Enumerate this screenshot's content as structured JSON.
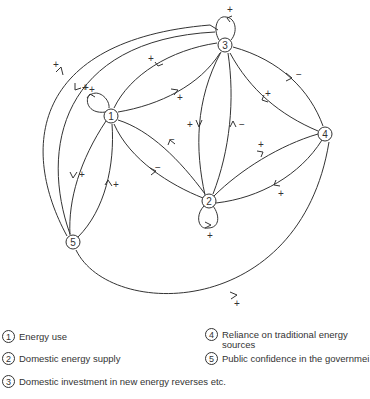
{
  "diagram": {
    "type": "causal-loop-diagram",
    "nodes": [
      {
        "id": "1",
        "label": "1"
      },
      {
        "id": "2",
        "label": "2"
      },
      {
        "id": "3",
        "label": "3"
      },
      {
        "id": "4",
        "label": "4"
      },
      {
        "id": "5",
        "label": "5"
      }
    ],
    "edges": [
      {
        "from": "1",
        "to": "1",
        "sign": "+"
      },
      {
        "from": "2",
        "to": "2",
        "sign": "+"
      },
      {
        "from": "3",
        "to": "3",
        "sign": "+"
      },
      {
        "from": "1",
        "to": "3",
        "sign": "+"
      },
      {
        "from": "3",
        "to": "1",
        "sign": "+"
      },
      {
        "from": "1",
        "to": "2",
        "sign": "−"
      },
      {
        "from": "2",
        "to": "1",
        "sign": "−"
      },
      {
        "from": "3",
        "to": "2",
        "sign": "+"
      },
      {
        "from": "2",
        "to": "3",
        "sign": "−"
      },
      {
        "from": "3",
        "to": "4",
        "sign": "−"
      },
      {
        "from": "4",
        "to": "3",
        "sign": "+"
      },
      {
        "from": "2",
        "to": "4",
        "sign": "+"
      },
      {
        "from": "4",
        "to": "2",
        "sign": "+"
      },
      {
        "from": "1",
        "to": "5",
        "sign": "+"
      },
      {
        "from": "5",
        "to": "1",
        "sign": "+"
      },
      {
        "from": "5",
        "to": "3",
        "sign": "+"
      },
      {
        "from": "3",
        "to": "5",
        "sign": "+"
      },
      {
        "from": "5",
        "to": "4",
        "sign": "+"
      }
    ]
  },
  "legend": {
    "items": [
      {
        "num": "1",
        "text": "Energy use"
      },
      {
        "num": "2",
        "text": "Domestic energy supply"
      },
      {
        "num": "3",
        "text": "Domestic investment in new energy reverses etc."
      },
      {
        "num": "4",
        "text": "Reliance on traditional energy",
        "text2": "sources"
      },
      {
        "num": "5",
        "text": "Public confidence in the governmei"
      }
    ]
  }
}
